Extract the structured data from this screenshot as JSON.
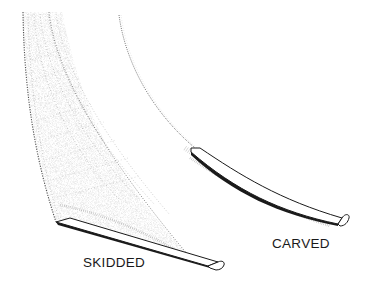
{
  "diagram": {
    "type": "ski-turn-comparison",
    "background": "#ffffff",
    "ink_color": "#1a1a1a",
    "labels": {
      "skidded": "SKIDDED",
      "carved": "CARVED"
    },
    "elements": [
      {
        "name": "skidded-track",
        "description": "wide stippled fan-shaped skid track with hatching lines"
      },
      {
        "name": "skidded-ski",
        "description": "ski drawn at the bottom of the skid track"
      },
      {
        "name": "carved-track",
        "description": "thin curved line track with spray"
      },
      {
        "name": "carved-ski",
        "description": "ski drawn at the end of the carved track"
      }
    ]
  }
}
